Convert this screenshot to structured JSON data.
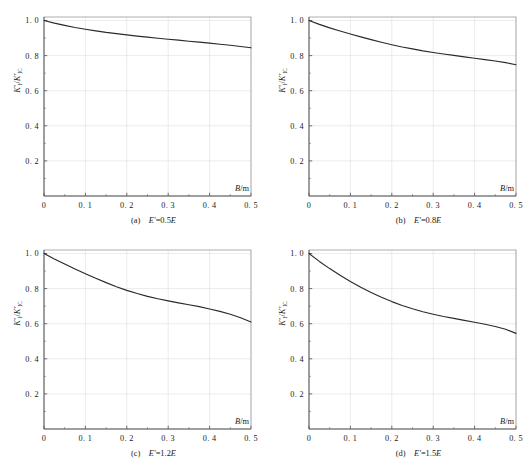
{
  "figure": {
    "title": "",
    "panel_count": 4
  },
  "chart_data": [
    {
      "type": "line",
      "panel_id": "a",
      "caption": "(a)  E′=0.5E",
      "caption_index": "(a)",
      "caption_expr": "E′=0.5E",
      "xlabel": "B/m",
      "ylabel": "K′I/K′IC",
      "ylabel_parts": {
        "num": "K",
        "num_prime": "′",
        "num_sub": "I",
        "den": "K",
        "den_prime": "′",
        "den_sub": "IC"
      },
      "xlim": [
        0,
        0.5
      ],
      "ylim": [
        0,
        1.02
      ],
      "xticks": [
        0,
        0.1,
        0.2,
        0.3,
        0.4,
        0.5
      ],
      "xticklabels": [
        "0",
        "0. 1",
        "0. 2",
        "0. 3",
        "0. 4",
        "0. 5"
      ],
      "yticks": [
        0.2,
        0.4,
        0.6,
        0.8,
        1.0
      ],
      "yticklabels": [
        "0. 2",
        "0. 4",
        "0. 6",
        "0. 8",
        "1. 0"
      ],
      "grid": true,
      "legend": null,
      "x": [
        0,
        0.025,
        0.05,
        0.075,
        0.1,
        0.125,
        0.15,
        0.175,
        0.2,
        0.225,
        0.25,
        0.275,
        0.3,
        0.325,
        0.35,
        0.375,
        0.4,
        0.425,
        0.45,
        0.475,
        0.5
      ],
      "y": [
        1.0,
        0.985,
        0.972,
        0.96,
        0.95,
        0.941,
        0.932,
        0.925,
        0.918,
        0.911,
        0.905,
        0.899,
        0.893,
        0.888,
        0.882,
        0.877,
        0.871,
        0.865,
        0.859,
        0.852,
        0.845
      ]
    },
    {
      "type": "line",
      "panel_id": "b",
      "caption": "(b)  E′=0.8E",
      "caption_index": "(b)",
      "caption_expr": "E′=0.8E",
      "xlabel": "B/m",
      "ylabel": "K′I/K′IC",
      "ylabel_parts": {
        "num": "K",
        "num_prime": "′",
        "num_sub": "I",
        "den": "K",
        "den_prime": "′",
        "den_sub": "IC"
      },
      "xlim": [
        0,
        0.5
      ],
      "ylim": [
        0,
        1.02
      ],
      "xticks": [
        0,
        0.1,
        0.2,
        0.3,
        0.4,
        0.5
      ],
      "xticklabels": [
        "0",
        "0. 1",
        "0. 2",
        "0. 3",
        "0. 4",
        "0. 5"
      ],
      "yticks": [
        0.2,
        0.4,
        0.6,
        0.8,
        1.0
      ],
      "yticklabels": [
        "0. 2",
        "0. 4",
        "0. 6",
        "0. 8",
        "1. 0"
      ],
      "grid": true,
      "legend": null,
      "x": [
        0,
        0.025,
        0.05,
        0.075,
        0.1,
        0.125,
        0.15,
        0.175,
        0.2,
        0.225,
        0.25,
        0.275,
        0.3,
        0.325,
        0.35,
        0.375,
        0.4,
        0.425,
        0.45,
        0.475,
        0.5
      ],
      "y": [
        1.0,
        0.978,
        0.958,
        0.94,
        0.923,
        0.907,
        0.891,
        0.876,
        0.862,
        0.849,
        0.838,
        0.827,
        0.818,
        0.809,
        0.801,
        0.793,
        0.785,
        0.777,
        0.769,
        0.76,
        0.748
      ]
    },
    {
      "type": "line",
      "panel_id": "c",
      "caption": "(c)  E′=1.2E",
      "caption_index": "(c)",
      "caption_expr": "E′=1.2E",
      "xlabel": "B/m",
      "ylabel": "K′I/K′IC",
      "ylabel_parts": {
        "num": "K",
        "num_prime": "′",
        "num_sub": "I",
        "den": "K",
        "den_prime": "′",
        "den_sub": "IC"
      },
      "xlim": [
        0,
        0.5
      ],
      "ylim": [
        0,
        1.02
      ],
      "xticks": [
        0,
        0.1,
        0.2,
        0.3,
        0.4,
        0.5
      ],
      "xticklabels": [
        "0",
        "0. 1",
        "0. 2",
        "0. 3",
        "0. 4",
        "0. 5"
      ],
      "yticks": [
        0.2,
        0.4,
        0.6,
        0.8,
        1.0
      ],
      "yticklabels": [
        "0. 2",
        "0. 4",
        "0. 6",
        "0. 8",
        "1. 0"
      ],
      "grid": true,
      "legend": null,
      "x": [
        0,
        0.025,
        0.05,
        0.075,
        0.1,
        0.125,
        0.15,
        0.175,
        0.2,
        0.225,
        0.25,
        0.275,
        0.3,
        0.325,
        0.35,
        0.375,
        0.4,
        0.425,
        0.45,
        0.475,
        0.5
      ],
      "y": [
        1.0,
        0.969,
        0.94,
        0.912,
        0.885,
        0.859,
        0.834,
        0.811,
        0.79,
        0.772,
        0.756,
        0.742,
        0.73,
        0.719,
        0.708,
        0.697,
        0.684,
        0.67,
        0.654,
        0.634,
        0.61
      ]
    },
    {
      "type": "line",
      "panel_id": "d",
      "caption": "(d)  E′=1.5E",
      "caption_index": "(d)",
      "caption_expr": "E′=1.5E",
      "xlabel": "B/m",
      "ylabel": "K′I/K′IC",
      "ylabel_parts": {
        "num": "K",
        "num_prime": "′",
        "num_sub": "I",
        "den": "K",
        "den_prime": "′",
        "den_sub": "IC"
      },
      "xlim": [
        0,
        0.5
      ],
      "ylim": [
        0,
        1.02
      ],
      "xticks": [
        0,
        0.1,
        0.2,
        0.3,
        0.4,
        0.5
      ],
      "xticklabels": [
        "0",
        "0. 1",
        "0. 2",
        "0. 3",
        "0. 4",
        "0. 5"
      ],
      "yticks": [
        0.2,
        0.4,
        0.6,
        0.8,
        1.0
      ],
      "yticklabels": [
        "0. 2",
        "0. 4",
        "0. 6",
        "0. 8",
        "1. 0"
      ],
      "grid": true,
      "legend": null,
      "x": [
        0,
        0.025,
        0.05,
        0.075,
        0.1,
        0.125,
        0.15,
        0.175,
        0.2,
        0.225,
        0.25,
        0.275,
        0.3,
        0.325,
        0.35,
        0.375,
        0.4,
        0.425,
        0.45,
        0.475,
        0.5
      ],
      "y": [
        1.0,
        0.955,
        0.914,
        0.876,
        0.841,
        0.808,
        0.778,
        0.751,
        0.726,
        0.704,
        0.685,
        0.668,
        0.654,
        0.641,
        0.63,
        0.619,
        0.608,
        0.597,
        0.584,
        0.568,
        0.545
      ]
    }
  ],
  "colors": {
    "curve": "#2a2a2a",
    "axis": "#4a4a4a",
    "grid": "#d8d8d8",
    "frame": "#8c8c8c",
    "background": "#ffffff"
  }
}
